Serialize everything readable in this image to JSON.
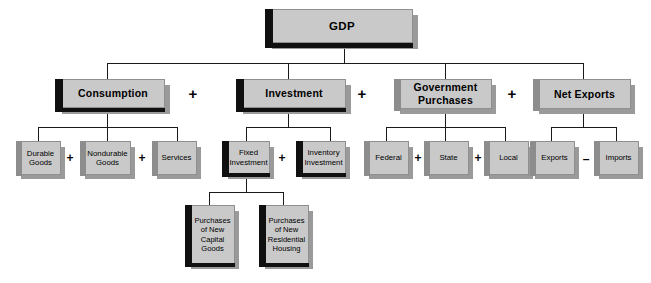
{
  "diagram": {
    "colors": {
      "box_fill": "#c9c9c9",
      "box_border": "#8f8f8f",
      "edge_dark": "#101010",
      "edge_gray": "#8d8d8d",
      "shadow": "#9a9a9a",
      "line": "#1a1a1a",
      "text": "#000000",
      "background": "#ffffff"
    },
    "root": {
      "label": "GDP"
    },
    "level2": [
      {
        "label": "Consumption"
      },
      {
        "label": "Investment"
      },
      {
        "label_line1": "Government",
        "label_line2": "Purchases"
      },
      {
        "label": "Net Exports"
      }
    ],
    "level3": {
      "consumption": [
        {
          "label_line1": "Durable",
          "label_line2": "Goods"
        },
        {
          "label_line1": "Nondurable",
          "label_line2": "Goods"
        },
        {
          "label_line1": "Services",
          "label_line2": ""
        }
      ],
      "investment": [
        {
          "label_line1": "Fixed",
          "label_line2": "Investment"
        },
        {
          "label_line1": "Inventory",
          "label_line2": "Investment"
        }
      ],
      "government": [
        {
          "label": "Federal"
        },
        {
          "label": "State"
        },
        {
          "label": "Local"
        }
      ],
      "net_exports": [
        {
          "label": "Exports"
        },
        {
          "label": "Imports"
        }
      ]
    },
    "level4": [
      {
        "line1": "Purchases",
        "line2": "of New",
        "line3": "Capital",
        "line4": "Goods"
      },
      {
        "line1": "Purchases",
        "line2": "of New",
        "line3": "Residential",
        "line4": "Housing"
      }
    ],
    "operators": {
      "plus": "+",
      "minus": "–"
    }
  }
}
